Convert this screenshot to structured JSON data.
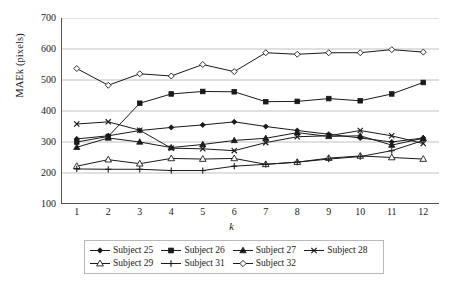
{
  "chart_data": {
    "type": "line",
    "title": "",
    "xlabel": "k",
    "ylabel": "MAEk (pixels)",
    "x": [
      1,
      2,
      3,
      4,
      5,
      6,
      7,
      8,
      9,
      10,
      11,
      12
    ],
    "xlim": [
      0.5,
      12.5
    ],
    "ylim": [
      100,
      700
    ],
    "yticks": [
      100,
      200,
      300,
      400,
      500,
      600,
      700
    ],
    "xticks": [
      "1",
      "2",
      "3",
      "4",
      "5",
      "6",
      "7",
      "8",
      "9",
      "10",
      "11",
      "12"
    ],
    "grid": "horizontal",
    "legend_position": "bottom",
    "series": [
      {
        "name": "Subject 25",
        "marker": "filled-diamond",
        "values": [
          310,
          320,
          337,
          347,
          355,
          365,
          350,
          337,
          325,
          313,
          300,
          313
        ]
      },
      {
        "name": "Subject 26",
        "marker": "filled-square",
        "values": [
          300,
          318,
          425,
          455,
          463,
          462,
          430,
          431,
          440,
          433,
          455,
          492
        ]
      },
      {
        "name": "Subject 27",
        "marker": "filled-triangle",
        "values": [
          283,
          313,
          300,
          282,
          292,
          305,
          312,
          330,
          318,
          320,
          290,
          312
        ]
      },
      {
        "name": "Subject 28",
        "marker": "cross-x",
        "values": [
          358,
          365,
          338,
          280,
          278,
          272,
          298,
          317,
          320,
          337,
          320,
          295
        ]
      },
      {
        "name": "Subject 29",
        "marker": "open-triangle",
        "values": [
          222,
          243,
          230,
          247,
          245,
          247,
          228,
          235,
          248,
          255,
          250,
          245
        ]
      },
      {
        "name": "Subject 31",
        "marker": "plus",
        "values": [
          213,
          212,
          212,
          208,
          208,
          222,
          228,
          235,
          245,
          253,
          272,
          305
        ]
      },
      {
        "name": "Subject 32",
        "marker": "open-diamond",
        "values": [
          537,
          483,
          520,
          513,
          550,
          527,
          588,
          583,
          588,
          588,
          598,
          590
        ]
      }
    ]
  },
  "legend": {
    "rows": [
      [
        "Subject 25",
        "Subject 26",
        "Subject 27",
        "Subject 28"
      ],
      [
        "Subject 29",
        "Subject 31",
        "Subject 32"
      ]
    ]
  }
}
